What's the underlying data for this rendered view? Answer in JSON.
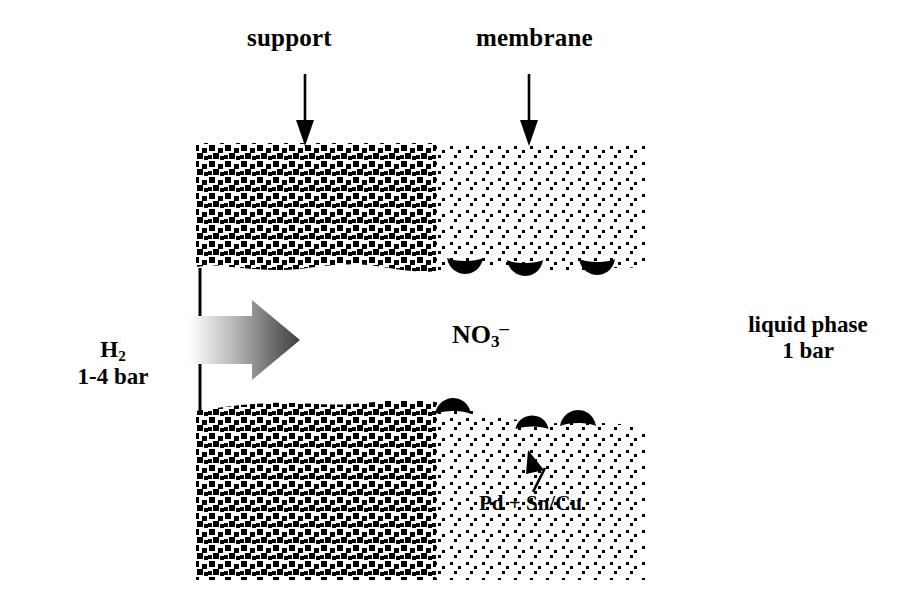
{
  "figure": {
    "width": 912,
    "height": 607,
    "background_color": "#ffffff",
    "ink_color": "#000000"
  },
  "labels": {
    "support": "support",
    "membrane": "membrane",
    "nitrate_ion": "NO",
    "nitrate_sub": "3",
    "nitrate_sup": "–",
    "gas_species": "H",
    "gas_sub": "2",
    "gas_pressure": "1-4 bar",
    "liquid_phase": "liquid phase",
    "liquid_pressure": "1 bar",
    "catalyst": "Pd + Sn/Cu"
  },
  "annotations": {
    "support_arrow": "down-arrow-icon",
    "membrane_arrow": "down-arrow-icon",
    "catalyst_arrow": "up-arrow-icon",
    "flow_arrow": "hydrogen-flow-arrow-icon"
  },
  "regions": {
    "support": {
      "name": "porous-support-layer",
      "pattern": "dense-squares",
      "x_start": 196,
      "x_end": 436,
      "fill": "#000000",
      "density": "high"
    },
    "membrane": {
      "name": "membrane-layer",
      "pattern": "sparse-dots",
      "x_start": 436,
      "x_end": 645,
      "fill": "#000000",
      "density": "low"
    },
    "upper_block": {
      "y_top": 143,
      "y_bottom": 272
    },
    "lower_block": {
      "y_top": 400,
      "y_bottom": 580
    },
    "channel": {
      "y_top": 272,
      "y_bottom": 400
    }
  },
  "flow_arrow": {
    "name": "hydrogen-flow-arrow",
    "direction": "right",
    "gradient_from": "#f2f2f2",
    "gradient_to": "#4a4a4a",
    "x_start": 188,
    "x_end": 300,
    "y_center": 340
  },
  "catalyst_particles": {
    "label": "Pd + Sn/Cu",
    "color": "#000000",
    "upper_edge": [
      {
        "cx": 465,
        "cy": 270,
        "rx": 17,
        "ry": 9
      },
      {
        "cx": 524,
        "cy": 272,
        "rx": 17,
        "ry": 9
      },
      {
        "cx": 596,
        "cy": 271,
        "rx": 17,
        "ry": 9
      }
    ],
    "lower_edge": [
      {
        "cx": 452,
        "cy": 409,
        "rx": 18,
        "ry": 9
      },
      {
        "cx": 531,
        "cy": 425,
        "rx": 16,
        "ry": 8
      },
      {
        "cx": 576,
        "cy": 421,
        "rx": 17,
        "ry": 9
      }
    ]
  },
  "divider_line": {
    "name": "support-inlet-face-line",
    "x": 200,
    "segments": [
      {
        "y1": 268,
        "y2": 318
      },
      {
        "y1": 363,
        "y2": 412
      }
    ],
    "color": "#000000",
    "width": 3
  }
}
